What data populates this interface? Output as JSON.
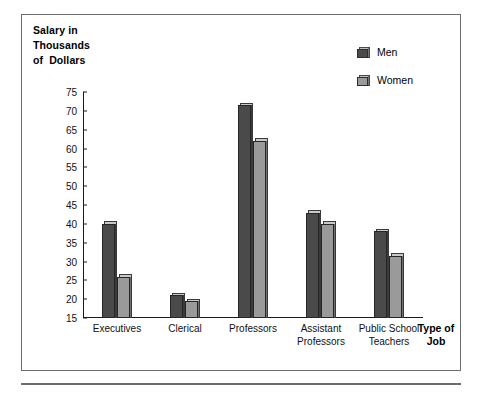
{
  "chart_data": {
    "type": "bar",
    "title": "",
    "ylabel": "Salary in Thousands of Dollars",
    "ylabel_lines": [
      "Salary in",
      "Thousands",
      "of  Dollars"
    ],
    "xlabel": "Type of Job",
    "xlabel_lines": [
      "Type of",
      "Job"
    ],
    "categories": [
      "Executives",
      "Clerical",
      "Professors",
      "Assistant Professors",
      "Public School Teachers"
    ],
    "category_lines": [
      [
        "Executives"
      ],
      [
        "Clerical"
      ],
      [
        "Professors"
      ],
      [
        "Assistant",
        "Professors"
      ],
      [
        "Public School",
        "Teachers"
      ]
    ],
    "series": [
      {
        "name": "Men",
        "color": "#4a4a4a",
        "values": [
          40,
          21,
          71.5,
          43,
          38
        ]
      },
      {
        "name": "Women",
        "color": "#9a9a9a",
        "values": [
          26,
          19.5,
          62,
          40,
          31.5
        ]
      }
    ],
    "ylim": [
      15,
      75
    ],
    "ytick_step": 5,
    "yticks": [
      75,
      70,
      65,
      60,
      55,
      50,
      45,
      40,
      35,
      30,
      25,
      20,
      15
    ],
    "grid": false,
    "legend_position": "top-right"
  },
  "legend": {
    "entries": [
      {
        "label": "Men"
      },
      {
        "label": "Women"
      }
    ]
  }
}
